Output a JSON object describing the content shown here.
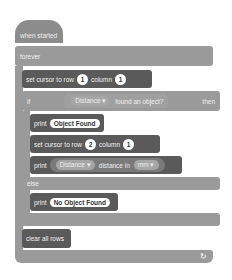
{
  "script": {
    "hat": {
      "label": "when started"
    },
    "forever": {
      "label": "forever",
      "loop_icon": "↻"
    },
    "set_cursor_1": {
      "label": "set cursor to row",
      "row": "1",
      "column_label": "column",
      "column": "1"
    },
    "if_block": {
      "if_label": "if",
      "sensor": "Distance",
      "condition": "found an object?",
      "then_label": "then",
      "else_label": "else"
    },
    "print_found": {
      "label": "print",
      "value": "Object Found"
    },
    "set_cursor_2": {
      "label": "set cursor to row",
      "row": "2",
      "column_label": "column",
      "column": "1"
    },
    "print_distance": {
      "label": "print",
      "sensor": "Distance",
      "reporter": "distance in",
      "unit": "mm"
    },
    "print_not_found": {
      "label": "print",
      "value": "No Object Found"
    },
    "clear": {
      "label": "clear all rows"
    }
  },
  "colors": {
    "control_block": "#9a9a9a",
    "looks_block": "#5a5a5a",
    "background": "#ffffff"
  }
}
